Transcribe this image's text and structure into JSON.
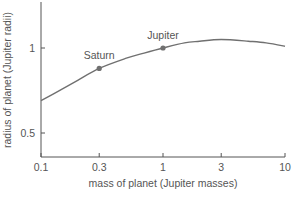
{
  "chart_data": {
    "type": "line",
    "title": "",
    "xlabel": "mass of planet (Jupiter masses)",
    "ylabel": "radius of planet (Jupiter radii)",
    "xscale": "log",
    "xlim": [
      0.1,
      10
    ],
    "ylim": [
      0.36,
      1.27
    ],
    "x_ticks": [
      {
        "value": 0.1,
        "label": "0.1"
      },
      {
        "value": 0.3,
        "label": "0.3"
      },
      {
        "value": 1,
        "label": "1"
      },
      {
        "value": 3,
        "label": "3"
      },
      {
        "value": 10,
        "label": "10"
      }
    ],
    "y_ticks": [
      {
        "value": 1,
        "label": "1"
      },
      {
        "value": 0.5,
        "label": "0.5"
      }
    ],
    "grid": false,
    "series": [
      {
        "name": "mass-radius relation",
        "x": [
          0.1,
          0.15,
          0.2,
          0.3,
          0.5,
          0.7,
          1,
          1.5,
          2,
          3,
          5,
          7,
          10
        ],
        "values": [
          0.69,
          0.76,
          0.81,
          0.88,
          0.94,
          0.97,
          1.0,
          1.03,
          1.04,
          1.05,
          1.04,
          1.03,
          1.01
        ]
      }
    ],
    "points": [
      {
        "label": "Saturn",
        "x": 0.3,
        "y": 0.88
      },
      {
        "label": "Jupiter",
        "x": 1,
        "y": 1.0
      }
    ],
    "colors": {
      "line": "#707070",
      "axis": "#555555",
      "marker": "#707070"
    }
  }
}
